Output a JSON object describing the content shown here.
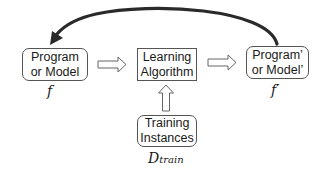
{
  "diagram": {
    "nodes": {
      "program": {
        "line1": "Program",
        "line2": "or Model",
        "symbol": "f"
      },
      "learning": {
        "line1": "Learning",
        "line2": "Algorithm"
      },
      "program_prime": {
        "line1": "Program’",
        "line2": "or Model’",
        "symbol": "f′"
      },
      "training": {
        "line1": "Training",
        "line2": "Instances",
        "symbol_main": "D",
        "symbol_sub": "train"
      }
    },
    "edges": [
      {
        "from": "program",
        "to": "learning",
        "style": "hollow-arrow"
      },
      {
        "from": "learning",
        "to": "program_prime",
        "style": "hollow-arrow"
      },
      {
        "from": "training",
        "to": "learning",
        "style": "hollow-arrow"
      },
      {
        "from": "program_prime",
        "to": "program",
        "style": "curved-solid-arrow"
      }
    ],
    "colors": {
      "stroke": "#555555",
      "curve": "#2a2a2a",
      "background": "#ffffff"
    }
  }
}
